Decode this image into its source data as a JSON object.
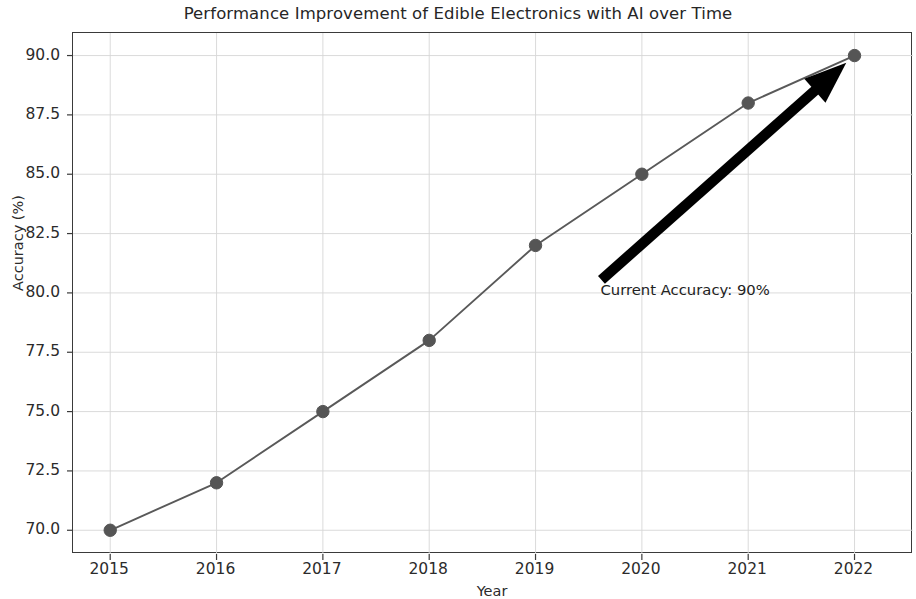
{
  "chart_data": {
    "type": "line",
    "title": "Performance Improvement of Edible Electronics with AI over Time",
    "xlabel": "Year",
    "ylabel": "Accuracy (%)",
    "x": [
      2015,
      2016,
      2017,
      2018,
      2019,
      2020,
      2021,
      2022
    ],
    "categories": [
      "2015",
      "2016",
      "2017",
      "2018",
      "2019",
      "2020",
      "2021",
      "2022"
    ],
    "values": [
      70.0,
      72.0,
      75.0,
      78.0,
      82.0,
      85.0,
      88.0,
      90.0
    ],
    "series": [
      {
        "name": "Accuracy",
        "values": [
          70.0,
          72.0,
          75.0,
          78.0,
          82.0,
          85.0,
          88.0,
          90.0
        ]
      }
    ],
    "xlim": [
      2014.65,
      2022.55
    ],
    "ylim": [
      69.0,
      90.95
    ],
    "yticks": [
      70.0,
      72.5,
      75.0,
      77.5,
      80.0,
      82.5,
      85.0,
      87.5,
      90.0
    ],
    "ytick_labels": [
      "70.0",
      "72.5",
      "75.0",
      "77.5",
      "80.0",
      "82.5",
      "85.0",
      "87.5",
      "90.0"
    ],
    "xticks": [
      2015,
      2016,
      2017,
      2018,
      2019,
      2020,
      2021,
      2022
    ],
    "xtick_labels": [
      "2015",
      "2016",
      "2017",
      "2018",
      "2019",
      "2020",
      "2021",
      "2022"
    ],
    "grid": true,
    "legend": null,
    "line_color": "#595959",
    "marker_color": "#555555",
    "marker": "circle",
    "annotations": [
      {
        "text": "Current Accuracy: 90%",
        "x": 2019.62,
        "y": 80.1,
        "arrow": {
          "from_x": 2019.62,
          "from_y": 80.55,
          "to_x": 2022.0,
          "to_y": 90.0,
          "color": "#000000"
        }
      }
    ]
  }
}
